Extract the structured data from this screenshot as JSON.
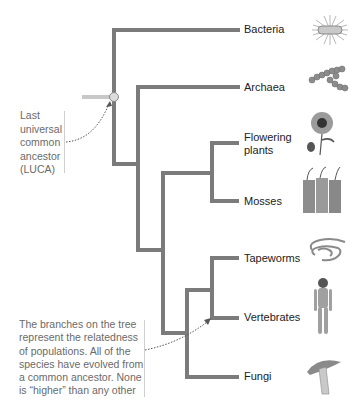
{
  "figure": {
    "branch_color": "#7b7b7b",
    "stub_color": "#c8c8c8",
    "luca_marker_color": "#d9d9d9"
  },
  "taxa": [
    {
      "id": "bacteria",
      "label": "Bacteria",
      "icon": "bacterium-icon"
    },
    {
      "id": "archaea",
      "label": "Archaea",
      "icon": "archaea-chain-icon"
    },
    {
      "id": "flowering-plants",
      "label": "Flowering\nplants",
      "icon": "sunflower-icon"
    },
    {
      "id": "mosses",
      "label": "Mosses",
      "icon": "moss-icon"
    },
    {
      "id": "tapeworms",
      "label": "Tapeworms",
      "icon": "tapeworm-icon"
    },
    {
      "id": "vertebrates",
      "label": "Vertebrates",
      "icon": "human-figure-icon"
    },
    {
      "id": "fungi",
      "label": "Fungi",
      "icon": "mushroom-icon"
    }
  ],
  "annotations": {
    "luca": "Last\nuniversal\ncommon\nancestor\n(LUCA)",
    "branches": "The branches on the tree\nrepresent the relatedness\nof populations. All of the\nspecies have evolved from\na common ancestor. None\nis “higher” than any other"
  }
}
